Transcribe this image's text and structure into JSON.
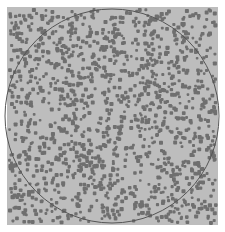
{
  "image": {
    "description": "Gray square field of randomly scattered dark dots with an inscribed circle outline",
    "background": "#ffffff",
    "field": {
      "x": 7,
      "y": 7,
      "width": 211,
      "height": 218,
      "color": "#bdbdbd"
    },
    "dots": {
      "color": "#6f6f6f",
      "count": 1400,
      "size": 3.2,
      "seed": 7
    },
    "circle": {
      "cx": 112,
      "cy": 116,
      "r": 107,
      "stroke": "#555555",
      "stroke_width": 1
    }
  }
}
